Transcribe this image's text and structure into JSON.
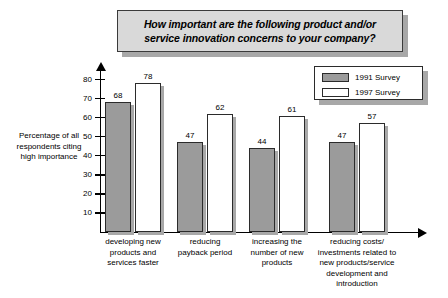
{
  "title": {
    "line1": "How important are the following product and/or",
    "line2": "service innovation concerns to your company?"
  },
  "legend": {
    "items": [
      {
        "label": "1991 Survey",
        "color": "#9b9b9b"
      },
      {
        "label": "1997 Survey",
        "color": "#ffffff"
      }
    ]
  },
  "axis": {
    "y_caption_line1": "Percentage of all",
    "y_caption_line2": "respondents citing",
    "y_caption_line3": "high importance",
    "y_ticks": [
      "80",
      "70",
      "60",
      "50",
      "40",
      "30",
      "20",
      "10"
    ]
  },
  "chart_data": {
    "type": "bar",
    "title": "How important are the following product and/or service innovation concerns to your company?",
    "xlabel": "",
    "ylabel": "Percentage of all respondents citing high importance",
    "ylim": [
      0,
      85
    ],
    "grid": false,
    "legend_position": "top-right",
    "categories": [
      "developing new products and services faster",
      "reducing payback period",
      "increasing the number of new products",
      "reducing costs/ investments related to new products/service development and introduction"
    ],
    "category_lines": [
      [
        "developing new",
        "products and",
        "services faster"
      ],
      [
        "reducing",
        "payback period"
      ],
      [
        "increasing the",
        "number of new",
        "products"
      ],
      [
        "reducing costs/",
        "investments related to",
        "new products/service",
        "development and",
        "introduction"
      ]
    ],
    "series": [
      {
        "name": "1991 Survey",
        "values": [
          68,
          47,
          44,
          47
        ]
      },
      {
        "name": "1997 Survey",
        "values": [
          78,
          62,
          61,
          57
        ]
      }
    ]
  }
}
